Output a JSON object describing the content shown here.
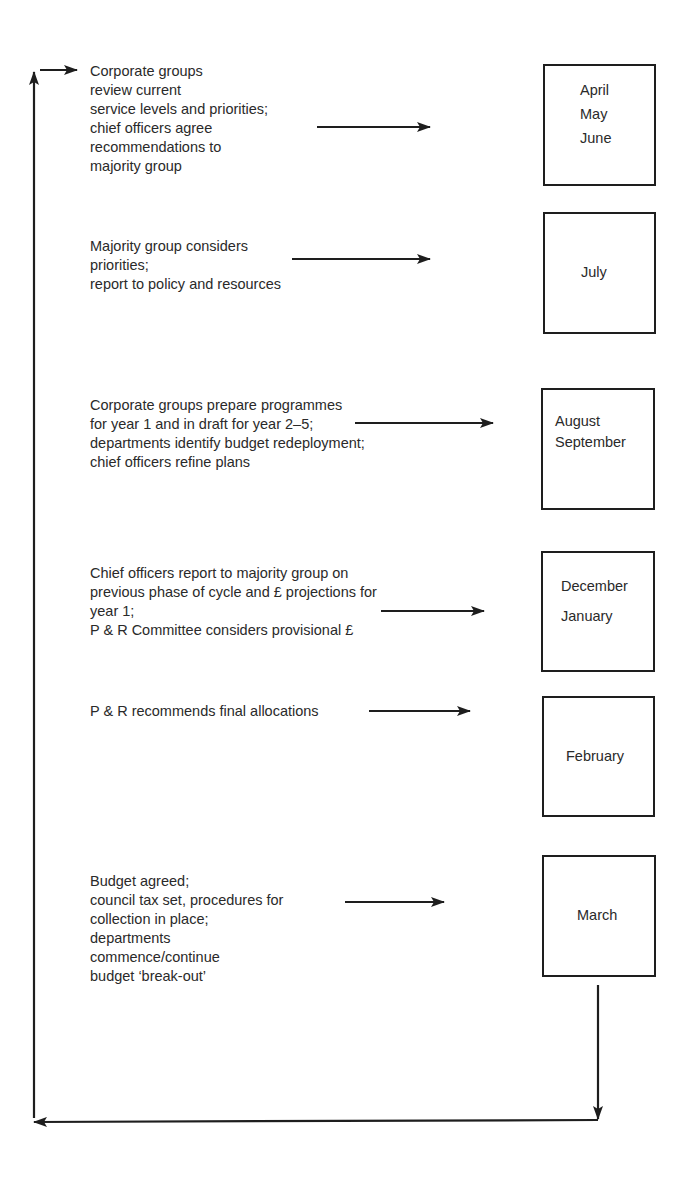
{
  "diagram": {
    "type": "budget-cycle-flowchart",
    "steps": [
      {
        "description_lines": [
          "Corporate groups",
          "review current",
          "service levels and priorities;",
          "chief officers agree",
          "recommendations to",
          "majority group"
        ],
        "months": [
          "April",
          "May",
          "June"
        ]
      },
      {
        "description_lines": [
          "Majority group considers",
          "priorities;",
          "report to policy and resources"
        ],
        "months": [
          "July"
        ]
      },
      {
        "description_lines": [
          "Corporate groups prepare programmes",
          "for year 1 and in draft for year 2–5;",
          "departments identify budget redeployment;",
          "chief officers refine plans"
        ],
        "months": [
          "August",
          "September"
        ]
      },
      {
        "description_lines": [
          "Chief officers report to majority group on",
          "previous phase of cycle and £ projections for",
          "year 1;",
          "P & R Committee considers provisional £"
        ],
        "months": [
          "December",
          "January"
        ]
      },
      {
        "description_lines": [
          "P & R recommends final allocations"
        ],
        "months": [
          "February"
        ]
      },
      {
        "description_lines": [
          "Budget agreed;",
          "council tax set, procedures for",
          "collection in place;",
          "departments",
          "commence/continue",
          "budget ‘break-out’"
        ],
        "months": [
          "March"
        ]
      }
    ],
    "connectors": {
      "step_to_month": "right-arrow",
      "within_box_aug_sep": "down-arrow",
      "return_loop": "March back to April (down, left, up, right)"
    },
    "colors": {
      "line": "#1e1e1e",
      "text": "#2a2a2a",
      "background": "#ffffff"
    }
  }
}
